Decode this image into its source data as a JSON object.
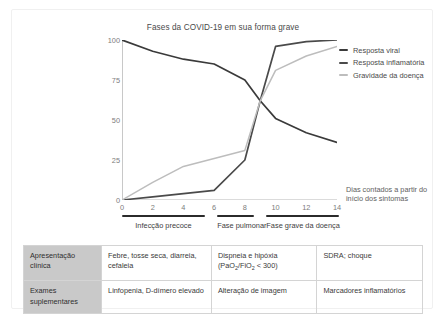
{
  "chart_data": {
    "type": "line",
    "title": "Fases da COVID-19 em sua forma grave",
    "xlabel": "Dias contados a partir do início dos sintomas",
    "ylabel": "",
    "xlim": [
      0,
      14
    ],
    "ylim": [
      0,
      100
    ],
    "grid": false,
    "legend_position": "right",
    "xticks": [
      "0",
      "2",
      "4",
      "6",
      "8",
      "10",
      "12",
      "14"
    ],
    "yticks": [
      "0",
      "25",
      "50",
      "75",
      "100"
    ],
    "x": [
      0,
      2,
      4,
      6,
      8,
      9,
      10,
      12,
      14
    ],
    "series": [
      {
        "name": "Resposta viral",
        "color": "#3a3a3a",
        "values": [
          100,
          93,
          88,
          85,
          75,
          62,
          51,
          42,
          36
        ]
      },
      {
        "name": "Resposta inflamatória",
        "color": "#4a4a4a",
        "values": [
          0,
          2,
          4,
          6,
          25,
          62,
          96,
          99,
          100
        ]
      },
      {
        "name": "Gravidade da doença",
        "color": "#bdbdbd",
        "values": [
          0,
          11,
          21,
          26,
          31,
          62,
          81,
          90,
          96
        ]
      }
    ],
    "phases": [
      {
        "label": "Infecção precoce",
        "start": 0,
        "end": 5.4
      },
      {
        "label": "Fase pulmonar",
        "start": 6.2,
        "end": 8.6
      },
      {
        "label": "Fase grave da doença",
        "start": 9.4,
        "end": 14.1
      }
    ]
  },
  "legend": {
    "items": [
      {
        "label": "Resposta viral",
        "color": "#3a3a3a"
      },
      {
        "label": "Resposta inflamatória",
        "color": "#4a4a4a"
      },
      {
        "label": "Gravidade da doença",
        "color": "#bdbdbd"
      }
    ]
  },
  "axis_caption": "Dias contados a partir do início dos sintomas",
  "table": {
    "rows": [
      {
        "head": "Apresentação clínica",
        "cells": [
          "Febre, tosse seca, diarreia, cefaleia",
          "Dispneia e hipóxia (PaO₂/FiO₂ < 300)",
          "SDRA; choque"
        ]
      },
      {
        "head": "Exames suplementares",
        "cells": [
          "Linfopenia, D-dímero elevado",
          "Alteração de imagem",
          "Marcadores inflamatórios"
        ]
      }
    ]
  }
}
